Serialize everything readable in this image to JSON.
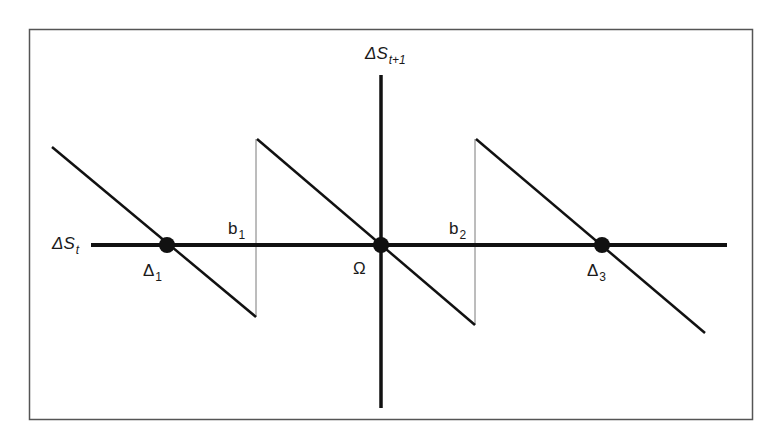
{
  "diagram": {
    "type": "piecewise-linear phase diagram",
    "colors": {
      "line": "#111111",
      "thin_line": "#7a7a7a",
      "frame": "#555555",
      "background": "#ffffff"
    },
    "frame": {
      "x": 29,
      "y": 29,
      "width": 723,
      "height": 390
    },
    "axes": {
      "x": {
        "label_main": "ΔS",
        "label_sub": "t",
        "x1": 91,
        "x2": 727,
        "y": 245
      },
      "y": {
        "label_main": "ΔS",
        "label_sub": "t+1",
        "x": 381,
        "y1": 75,
        "y2": 408
      }
    },
    "segments": [
      {
        "name": "branch-1",
        "x1": 52,
        "y1": 147,
        "x2": 256,
        "y2": 317
      },
      {
        "name": "branch-2",
        "x1": 257,
        "y1": 139,
        "x2": 475,
        "y2": 325
      },
      {
        "name": "branch-3",
        "x1": 476,
        "y1": 139,
        "x2": 705,
        "y2": 333
      }
    ],
    "discontinuities": [
      {
        "name": "b1",
        "label_main": "b",
        "label_sub": "1",
        "x": 256,
        "y1": 139,
        "y2": 317
      },
      {
        "name": "b2",
        "label_main": "b",
        "label_sub": "2",
        "x": 475,
        "y1": 139,
        "y2": 325
      }
    ],
    "fixed_points": [
      {
        "name": "delta-1",
        "label_main": "Δ",
        "label_sub": "1",
        "x": 167,
        "y": 245
      },
      {
        "name": "omega",
        "label_main": "Ω",
        "label_sub": "",
        "x": 381,
        "y": 245
      },
      {
        "name": "delta-3",
        "label_main": "Δ",
        "label_sub": "3",
        "x": 602,
        "y": 245
      }
    ]
  }
}
